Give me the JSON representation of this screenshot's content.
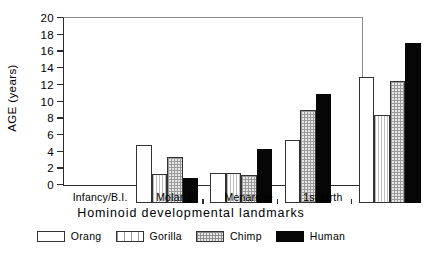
{
  "chart_data": {
    "type": "bar",
    "title": "",
    "xlabel": "Hominoid developmental landmarks",
    "ylabel": "AGE (years)",
    "ylim": [
      0,
      20
    ],
    "yticks": [
      0,
      2,
      4,
      6,
      8,
      10,
      12,
      14,
      16,
      18,
      20
    ],
    "grid": false,
    "legend_position": "below",
    "categories": [
      "Infancy/B.I.",
      "Molar 1",
      "Menarche",
      "1st birth"
    ],
    "series": [
      {
        "name": "Orang",
        "fill": "open",
        "color": "#ffffff",
        "values": [
          7.0,
          3.6,
          7.6,
          15.1
        ]
      },
      {
        "name": "Gorilla",
        "fill": "vertical-lines",
        "color": "#ffffff",
        "values": [
          3.5,
          3.6,
          null,
          10.6
        ]
      },
      {
        "name": "Chimp",
        "fill": "stipple",
        "color": "#e8e8e8",
        "values": [
          5.5,
          3.4,
          11.1,
          14.6
        ]
      },
      {
        "name": "Human",
        "fill": "solid",
        "color": "#060606",
        "values": [
          3.0,
          6.5,
          13.1,
          19.2
        ]
      }
    ]
  },
  "legend": {
    "items": [
      {
        "label": "Orang",
        "swatch": "orang-swatch-icon"
      },
      {
        "label": "Gorilla",
        "swatch": "gorilla-swatch-icon"
      },
      {
        "label": "Chimp",
        "swatch": "chimp-swatch-icon"
      },
      {
        "label": "Human",
        "swatch": "human-swatch-icon"
      }
    ]
  }
}
